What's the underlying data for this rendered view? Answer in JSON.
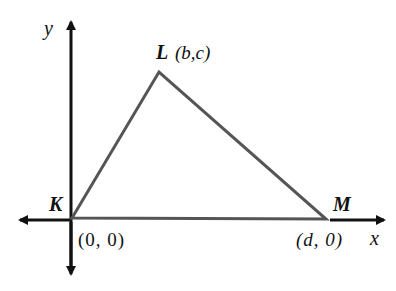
{
  "diagram": {
    "type": "coordinate-geometry",
    "axes": {
      "x_label": "x",
      "y_label": "y"
    },
    "triangle": {
      "vertices": [
        {
          "name": "K",
          "coords": "(0, 0)"
        },
        {
          "name": "L",
          "coords": "(b,c)"
        },
        {
          "name": "M",
          "coords": "(d, 0)"
        }
      ]
    },
    "colors": {
      "axes": "#111111",
      "triangle": "#555555"
    }
  }
}
